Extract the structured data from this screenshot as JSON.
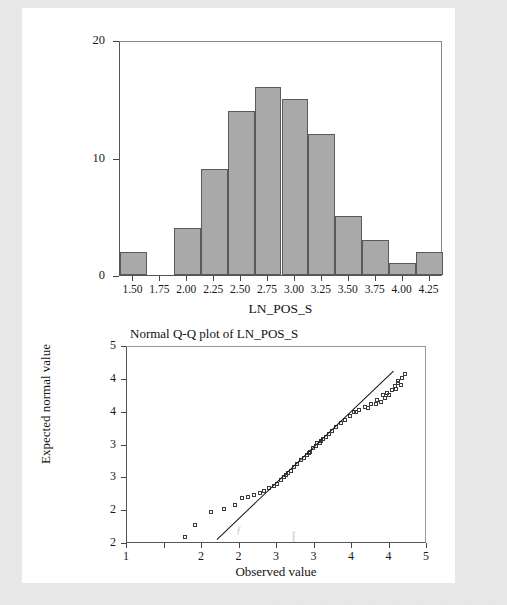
{
  "page": {
    "background_color": "#eaeaea",
    "panel_color": "#ffffff"
  },
  "chart_data": [
    {
      "type": "bar",
      "id": "histogram",
      "title": "",
      "xlabel": "LN_POS_S",
      "ylabel": "",
      "bar_color": "#a9a9a9",
      "bar_edge_color": "#5a5a5a",
      "grid": false,
      "xlim": [
        1.375,
        4.375
      ],
      "ylim": [
        0,
        20
      ],
      "y_ticks": [
        0,
        10,
        20
      ],
      "y_tick_labels": [
        "0",
        "10",
        "20"
      ],
      "x_ticks": [
        1.5,
        1.75,
        2.0,
        2.25,
        2.5,
        2.75,
        3.0,
        3.25,
        3.5,
        3.75,
        4.0,
        4.25
      ],
      "x_tick_labels": [
        "1.50",
        "1.75",
        "2.00",
        "2.25",
        "2.50",
        "2.75",
        "3.00",
        "3.25",
        "3.50",
        "3.75",
        "4.00",
        "4.25"
      ],
      "bin_width": 0.25,
      "categories": [
        "1.50",
        "1.75",
        "2.00",
        "2.25",
        "2.50",
        "2.75",
        "3.00",
        "3.25",
        "3.50",
        "3.75",
        "4.00",
        "4.25"
      ],
      "values": [
        2,
        0,
        4,
        9,
        14,
        16,
        15,
        12,
        5,
        3,
        1,
        2
      ]
    },
    {
      "type": "scatter",
      "id": "qq-plot",
      "title": "Normal Q-Q plot of LN_POS_S",
      "xlabel": "Observed value",
      "ylabel": "Expected normal value",
      "grid": false,
      "xlim": [
        1.0,
        5.0
      ],
      "ylim": [
        2.0,
        5.0
      ],
      "x_ticks": [
        1.0,
        1.5,
        2.0,
        2.5,
        3.0,
        3.5,
        4.0,
        4.5,
        5.0
      ],
      "x_tick_labels": [
        "1",
        "",
        "2",
        "2",
        "3",
        "3",
        "4",
        "4",
        "5"
      ],
      "y_ticks": [
        2.0,
        2.5,
        3.0,
        3.5,
        4.0,
        4.5,
        5.0
      ],
      "y_tick_labels": [
        "2",
        "2",
        "3",
        "3",
        "4",
        "4",
        "5"
      ],
      "reference_line": {
        "x": [
          2.2,
          4.55
        ],
        "y": [
          2.07,
          4.63
        ],
        "color": "#111111"
      },
      "marker": "open-square",
      "marker_color": "#3b3b3b",
      "points": [
        {
          "x": 1.78,
          "y": 2.09
        },
        {
          "x": 1.92,
          "y": 2.28
        },
        {
          "x": 2.13,
          "y": 2.47
        },
        {
          "x": 2.45,
          "y": 2.58
        },
        {
          "x": 2.55,
          "y": 2.68
        },
        {
          "x": 2.62,
          "y": 2.7
        },
        {
          "x": 2.78,
          "y": 2.76
        },
        {
          "x": 2.84,
          "y": 2.79
        },
        {
          "x": 2.97,
          "y": 2.87
        },
        {
          "x": 3.01,
          "y": 2.9
        },
        {
          "x": 3.06,
          "y": 2.96
        },
        {
          "x": 3.1,
          "y": 3.0
        },
        {
          "x": 3.16,
          "y": 3.06
        },
        {
          "x": 3.2,
          "y": 3.1
        },
        {
          "x": 3.24,
          "y": 3.16
        },
        {
          "x": 3.28,
          "y": 3.21
        },
        {
          "x": 3.33,
          "y": 3.26
        },
        {
          "x": 3.37,
          "y": 3.3
        },
        {
          "x": 3.41,
          "y": 3.34
        },
        {
          "x": 3.45,
          "y": 3.39
        },
        {
          "x": 3.49,
          "y": 3.44
        },
        {
          "x": 3.53,
          "y": 3.48
        },
        {
          "x": 3.58,
          "y": 3.53
        },
        {
          "x": 3.62,
          "y": 3.58
        },
        {
          "x": 3.66,
          "y": 3.62
        },
        {
          "x": 3.7,
          "y": 3.66
        },
        {
          "x": 3.75,
          "y": 3.71
        },
        {
          "x": 3.8,
          "y": 3.76
        },
        {
          "x": 3.86,
          "y": 3.82
        },
        {
          "x": 3.92,
          "y": 3.88
        },
        {
          "x": 3.98,
          "y": 3.94
        },
        {
          "x": 4.04,
          "y": 3.99
        },
        {
          "x": 4.1,
          "y": 4.03
        },
        {
          "x": 4.18,
          "y": 4.07
        },
        {
          "x": 4.26,
          "y": 4.12
        },
        {
          "x": 4.35,
          "y": 4.18
        },
        {
          "x": 3.55,
          "y": 3.52
        },
        {
          "x": 3.6,
          "y": 3.56
        },
        {
          "x": 4.42,
          "y": 4.25
        },
        {
          "x": 4.22,
          "y": 4.05
        },
        {
          "x": 4.07,
          "y": 4.0
        },
        {
          "x": 4.48,
          "y": 4.29
        },
        {
          "x": 4.54,
          "y": 4.33
        },
        {
          "x": 4.58,
          "y": 4.39
        },
        {
          "x": 4.62,
          "y": 4.44
        },
        {
          "x": 4.33,
          "y": 4.11
        },
        {
          "x": 4.4,
          "y": 4.15
        },
        {
          "x": 4.45,
          "y": 4.21
        },
        {
          "x": 4.5,
          "y": 4.26
        },
        {
          "x": 4.62,
          "y": 4.47
        },
        {
          "x": 4.68,
          "y": 4.51
        },
        {
          "x": 4.72,
          "y": 4.57
        },
        {
          "x": 4.6,
          "y": 4.35
        },
        {
          "x": 4.66,
          "y": 4.41
        },
        {
          "x": 2.3,
          "y": 2.52
        },
        {
          "x": 2.7,
          "y": 2.73
        },
        {
          "x": 2.9,
          "y": 2.83
        },
        {
          "x": 3.13,
          "y": 3.03
        },
        {
          "x": 3.44,
          "y": 3.37
        }
      ]
    }
  ],
  "histogram": {
    "xlabel": "LN_POS_S",
    "y_labels": [
      "20",
      "10",
      "0"
    ],
    "x_labels": [
      "1.50",
      "1.75",
      "2.00",
      "2.25",
      "2.50",
      "2.75",
      "3.00",
      "3.25",
      "3.50",
      "3.75",
      "4.00",
      "4.25"
    ]
  },
  "qq": {
    "title": "Normal Q-Q plot of LN_POS_S",
    "xlabel": "Observed value",
    "ylabel": "Expected normal value",
    "y_labels": [
      "5",
      "4",
      "4",
      "3",
      "3",
      "2",
      "2"
    ],
    "x_labels": [
      "1",
      "2",
      "2",
      "3",
      "3",
      "4",
      "4",
      "5"
    ]
  }
}
